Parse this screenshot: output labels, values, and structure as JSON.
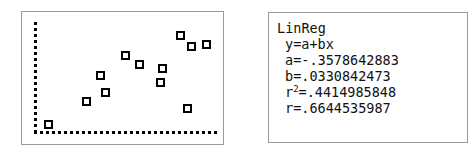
{
  "screen": {
    "device": "graphing-calculator-screens",
    "panels": 2
  },
  "scatter": {
    "title": "",
    "axis_style": "dotted",
    "marker": "open-square"
  },
  "linreg": {
    "title": "LinReg",
    "model": "y=a+bx",
    "a_label": "a=",
    "a_value": "-.3578642883",
    "b_label": "b=",
    "b_value": ".0330842473",
    "r2_label": "r",
    "r2_sup": "2",
    "r2_eq": "=",
    "r2_value": ".4414985848",
    "r_label": "r=",
    "r_value": ".6644535987",
    "line_a": "a=-.3578642883",
    "line_b": "b=.0330842473",
    "line_r2_rest": "=.4414985848",
    "line_r": "r=.6644535987"
  },
  "chart_data": {
    "type": "scatter",
    "title": "",
    "xlabel": "",
    "ylabel": "",
    "grid": false,
    "legend": null,
    "xlim": [
      0,
      100
    ],
    "ylim": [
      0,
      100
    ],
    "series": [
      {
        "name": "data",
        "marker": "open-square",
        "points": [
          {
            "px": 47,
            "py": 123,
            "x": 7,
            "y": 11
          },
          {
            "px": 85,
            "py": 100,
            "x": 29,
            "y": 31
          },
          {
            "px": 99,
            "py": 74,
            "x": 37,
            "y": 53
          },
          {
            "px": 104,
            "py": 91,
            "x": 40,
            "y": 38
          },
          {
            "px": 124,
            "py": 54,
            "x": 51,
            "y": 70
          },
          {
            "px": 138,
            "py": 63,
            "x": 59,
            "y": 62
          },
          {
            "px": 159,
            "py": 81,
            "x": 71,
            "y": 47
          },
          {
            "px": 161,
            "py": 67,
            "x": 72,
            "y": 59
          },
          {
            "px": 179,
            "py": 34,
            "x": 83,
            "y": 87
          },
          {
            "px": 186,
            "py": 107,
            "x": 87,
            "y": 25
          },
          {
            "px": 190,
            "py": 45,
            "x": 89,
            "y": 78
          },
          {
            "px": 205,
            "py": 43,
            "x": 97,
            "y": 79
          }
        ]
      }
    ],
    "fit": {
      "type": "linear",
      "equation": "y=a+bx",
      "a": -0.3578642883,
      "b": 0.0330842473,
      "r_squared": 0.4414985848,
      "r": 0.6644535987
    }
  }
}
